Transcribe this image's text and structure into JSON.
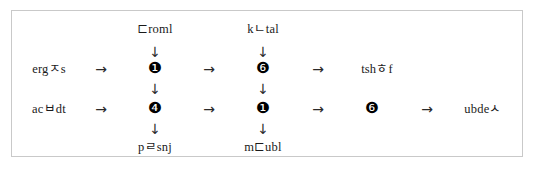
{
  "diagram": {
    "type": "flowchart",
    "border_color": "#c9c9c9",
    "background_color": "#ffffff",
    "text_color": "#1a1a1a",
    "arrow_right_glyph": "→",
    "arrow_down_glyph": "↓",
    "nodes": {
      "top_label_1": "⊏roml",
      "top_label_2": "kㄴtal",
      "row1_label_left": "ergㅈs",
      "row1_node_1": "❶",
      "row1_node_2": "❻",
      "row1_label_right": "tshㅎf",
      "row2_label_left": "acㅂdt",
      "row2_node_1": "❹",
      "row2_node_2": "❶",
      "row2_node_3": "❻",
      "row2_label_right": "ubdeㅅ",
      "bottom_label_1": "pㄹsnj",
      "bottom_label_2": "m⊏ubl"
    },
    "arrows": {
      "row1_arrow_1": "→",
      "row1_arrow_2": "→",
      "row1_arrow_3": "→",
      "row2_arrow_1": "→",
      "row2_arrow_2": "→",
      "row2_arrow_3": "→",
      "row2_arrow_4": "→",
      "down_top_1": "↓",
      "down_top_2": "↓",
      "down_mid_1": "↓",
      "down_mid_2": "↓",
      "down_bottom_1": "↓",
      "down_bottom_2": "↓"
    }
  }
}
